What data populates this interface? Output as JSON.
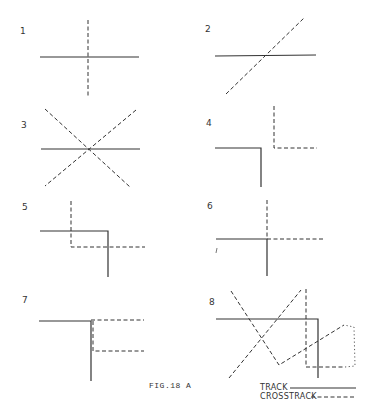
{
  "figure": {
    "caption": "FIG.18 A",
    "panels": [
      {
        "label": "1",
        "description": "track and crosstrack crossing perpendicular"
      },
      {
        "label": "2",
        "description": "crosstrack crossing track diagonally"
      },
      {
        "label": "3",
        "description": "two crosstracks crossing track at the same point"
      },
      {
        "label": "4",
        "description": "track corner and separate crosstrack corner"
      },
      {
        "label": "5",
        "description": "crosstrack corner overlapping track corner"
      },
      {
        "label": "6",
        "description": "track corner joined by crosstrack corner"
      },
      {
        "label": "7",
        "description": "track corner with parallel crosstrack offsets"
      },
      {
        "label": "8",
        "description": "complex combination of track and crosstracks"
      }
    ],
    "legend": {
      "items": [
        {
          "label": "TRACK",
          "style": "solid"
        },
        {
          "label": "CROSSTRACK",
          "style": "dashed"
        }
      ]
    }
  }
}
